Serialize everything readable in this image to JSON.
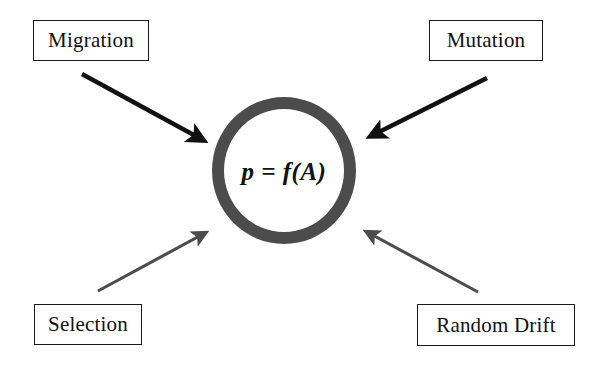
{
  "diagram": {
    "background_color": "#ffffff",
    "center": {
      "formula": "p = f(A)",
      "ring_color": "#4c4c4c",
      "ring_thickness_px": 12
    },
    "factors": [
      {
        "id": "migration",
        "label": "Migration",
        "position": "top-left",
        "arrow_color": "#111111",
        "arrow_style": "thick-black",
        "arrow_from": [
          82,
          74
        ],
        "arrow_to": [
          207,
          143
        ]
      },
      {
        "id": "mutation",
        "label": "Mutation",
        "position": "top-right",
        "arrow_color": "#111111",
        "arrow_style": "thick-black",
        "arrow_from": [
          487,
          78
        ],
        "arrow_to": [
          366,
          139
        ]
      },
      {
        "id": "selection",
        "label": "Selection",
        "position": "bottom-left",
        "arrow_color": "#4c4c4c",
        "arrow_style": "thin-gray",
        "arrow_from": [
          98,
          291
        ],
        "arrow_to": [
          210,
          230
        ]
      },
      {
        "id": "random-drift",
        "label": "Random Drift",
        "position": "bottom-right",
        "arrow_color": "#4c4c4c",
        "arrow_style": "thin-gray",
        "arrow_from": [
          478,
          292
        ],
        "arrow_to": [
          362,
          229
        ]
      }
    ]
  }
}
